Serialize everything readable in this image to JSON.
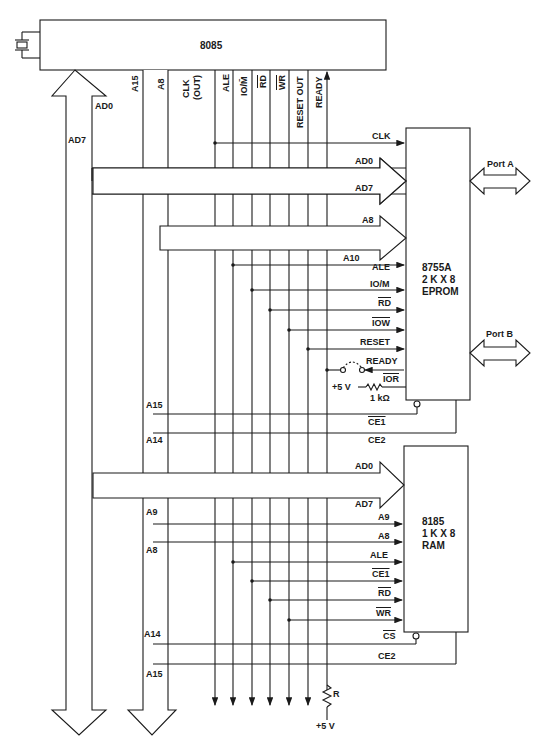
{
  "cpu": {
    "name": "8085"
  },
  "cpu_pins": [
    {
      "label": "A15"
    },
    {
      "label": "A8"
    },
    {
      "label": "CLK"
    },
    {
      "label": "(OUT)"
    },
    {
      "label": "ALE"
    },
    {
      "label": "IO/M̄"
    },
    {
      "label": "RD"
    },
    {
      "label": "WR"
    },
    {
      "label": "RESET OUT"
    },
    {
      "label": "READY"
    }
  ],
  "buses": {
    "ad7": "AD7",
    "ad0": "AD0"
  },
  "eprom": {
    "name": "8755A",
    "size": "2 K X 8",
    "type": "EPROM",
    "signals": {
      "clk": "CLK",
      "ad0": "AD0",
      "ad7": "AD7",
      "a8": "A8",
      "a10": "A10",
      "ale": "ALE",
      "iom": "IO/M",
      "rd": "RD",
      "iow": "IOW",
      "reset": "RESET",
      "ready": "READY",
      "ior": "IOR",
      "vcc": "+5 V",
      "res": "1 kΩ",
      "ce1": "CE1",
      "ce2": "CE2"
    },
    "port_a": "Port A",
    "port_b": "Port B",
    "addr_left": {
      "a15": "A15",
      "a14": "A14"
    }
  },
  "ram": {
    "name": "8185",
    "size": "1 K X 8",
    "type": "RAM",
    "signals": {
      "ad0": "AD0",
      "ad7": "AD7",
      "a9": "A9",
      "a8": "A8",
      "ale": "ALE",
      "ce1": "CE1",
      "rd": "RD",
      "wr": "WR",
      "cs": "CS",
      "ce2": "CE2"
    },
    "addr_left": {
      "a9": "A9",
      "a8": "A8",
      "a14": "A14",
      "a15": "A15"
    }
  },
  "pullup": {
    "r": "R",
    "vcc": "+5 V"
  }
}
